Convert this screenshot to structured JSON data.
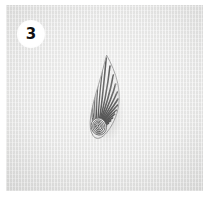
{
  "figure": {
    "panel_label": "3",
    "panel_label_icon": "circled-number-badge",
    "caption": "",
    "plate": {
      "image_kind": "grayscale-photomicrograph",
      "background_color": "#e8e8e7",
      "border_color": "#ffffff",
      "alt_text": "Grayscale photomicrograph of a teardrop-shaped ribbed specimen on a plain light gray background"
    },
    "specimen": {
      "name": "ribbed-teardrop-specimen",
      "shape": "teardrop",
      "orientation": "apex-up",
      "surface_pattern": "radiating-ribs",
      "base_feature": "concentric-spiral-whorl",
      "rib_color_dark": "#2a2a2a",
      "rib_color_light": "#f2f2f2",
      "outline_color": "#6b6b6b"
    }
  }
}
